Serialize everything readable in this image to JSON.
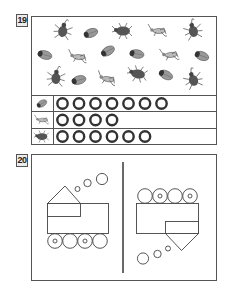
{
  "problems": [
    {
      "number": "19",
      "bugs": [
        {
          "type": "horned-beetle",
          "x": 63,
          "y": 30
        },
        {
          "type": "cicada",
          "x": 91,
          "y": 33
        },
        {
          "type": "round-beetle",
          "x": 123,
          "y": 31
        },
        {
          "type": "grasshopper",
          "x": 158,
          "y": 31
        },
        {
          "type": "horned-beetle",
          "x": 193,
          "y": 30
        },
        {
          "type": "cicada",
          "x": 45,
          "y": 55
        },
        {
          "type": "grasshopper",
          "x": 78,
          "y": 57
        },
        {
          "type": "cicada",
          "x": 108,
          "y": 51
        },
        {
          "type": "cicada",
          "x": 137,
          "y": 54
        },
        {
          "type": "grasshopper",
          "x": 170,
          "y": 55
        },
        {
          "type": "cicada",
          "x": 202,
          "y": 56
        },
        {
          "type": "horned-beetle",
          "x": 56,
          "y": 77
        },
        {
          "type": "cicada",
          "x": 79,
          "y": 80
        },
        {
          "type": "grasshopper",
          "x": 107,
          "y": 79
        },
        {
          "type": "round-beetle",
          "x": 138,
          "y": 74
        },
        {
          "type": "cicada",
          "x": 166,
          "y": 75
        },
        {
          "type": "horned-beetle",
          "x": 193,
          "y": 79
        }
      ],
      "tally_rows": [
        {
          "bug": "cicada",
          "circles": 7
        },
        {
          "bug": "grasshopper",
          "circles": 4
        },
        {
          "bug": "beetle",
          "circles": 6
        }
      ]
    },
    {
      "number": "20",
      "left_train": {
        "direction": "right",
        "wheels": 4,
        "smoke_puffs": 3
      },
      "right_train": {
        "direction": "flipped",
        "wheels": 4,
        "smoke_puffs": 3
      }
    }
  ],
  "colors": {
    "line": "#444444",
    "bug": "#555555",
    "circle": "#333333"
  }
}
